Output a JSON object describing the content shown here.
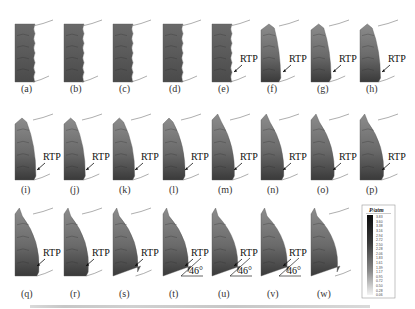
{
  "figure": {
    "panels": [
      {
        "label": "(a)",
        "rtp": false,
        "angle": null,
        "stage": 0
      },
      {
        "label": "(b)",
        "rtp": false,
        "angle": null,
        "stage": 1
      },
      {
        "label": "(c)",
        "rtp": false,
        "angle": null,
        "stage": 2
      },
      {
        "label": "(d)",
        "rtp": false,
        "angle": null,
        "stage": 3
      },
      {
        "label": "(e)",
        "rtp": true,
        "angle": null,
        "stage": 4
      },
      {
        "label": "(f)",
        "rtp": true,
        "angle": null,
        "stage": 5
      },
      {
        "label": "(g)",
        "rtp": true,
        "angle": null,
        "stage": 6
      },
      {
        "label": "(h)",
        "rtp": true,
        "angle": null,
        "stage": 7
      },
      {
        "label": "(i)",
        "rtp": true,
        "angle": null,
        "stage": 8
      },
      {
        "label": "(j)",
        "rtp": true,
        "angle": null,
        "stage": 9
      },
      {
        "label": "(k)",
        "rtp": true,
        "angle": null,
        "stage": 10
      },
      {
        "label": "(l)",
        "rtp": true,
        "angle": null,
        "stage": 11
      },
      {
        "label": "(m)",
        "rtp": true,
        "angle": null,
        "stage": 12
      },
      {
        "label": "(n)",
        "rtp": true,
        "angle": null,
        "stage": 13
      },
      {
        "label": "(o)",
        "rtp": true,
        "angle": null,
        "stage": 14
      },
      {
        "label": "(p)",
        "rtp": true,
        "angle": null,
        "stage": 15
      },
      {
        "label": "(q)",
        "rtp": true,
        "angle": null,
        "stage": 16
      },
      {
        "label": "(r)",
        "rtp": true,
        "angle": null,
        "stage": 17
      },
      {
        "label": "(s)",
        "rtp": true,
        "angle": null,
        "stage": 18
      },
      {
        "label": "(t)",
        "rtp": true,
        "angle": "46°",
        "stage": 19
      },
      {
        "label": "(u)",
        "rtp": true,
        "angle": "46°",
        "stage": 20
      },
      {
        "label": "(v)",
        "rtp": true,
        "angle": "46°",
        "stage": 21
      },
      {
        "label": "(w)",
        "rtp": false,
        "angle": null,
        "stage": 22
      }
    ],
    "rtp_text": "RTP"
  },
  "colorbar": {
    "title": "P/atm",
    "ticks": [
      "3.83",
      "3.60",
      "3.38",
      "3.16",
      "2.94",
      "2.72",
      "2.50",
      "2.28",
      "2.06",
      "1.83",
      "1.61",
      "1.39",
      "1.17",
      "0.95",
      "0.72",
      "0.50",
      "0.28",
      "0.06"
    ],
    "max_color": "#111111",
    "min_color": "#f2f2f2"
  }
}
